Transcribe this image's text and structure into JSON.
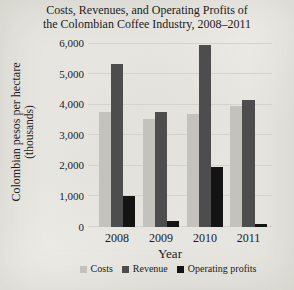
{
  "figure": {
    "background": "#ecebe6",
    "text_color": "#1b1b1b",
    "grid_color": "#d3d2cd"
  },
  "chart_data": {
    "type": "bar",
    "title": "Costs, Revenues, and Operating Profits of the Colombian Coffee Industry, 2008–2011",
    "title_line1": "Costs, Revenues, and Operating Profits of",
    "title_line2": "the Colombian Coffee Industry, 2008–2011",
    "ylabel_line1": "Colombian pesos per hectare",
    "ylabel_line2": "(thousands)",
    "xlabel": "Year",
    "categories": [
      "2008",
      "2009",
      "2010",
      "2011"
    ],
    "series": [
      {
        "name": "Costs",
        "color": "#c3c2bd",
        "values": [
          3750,
          3550,
          3700,
          3950
        ]
      },
      {
        "name": "Revenue",
        "color": "#4d4d4d",
        "values": [
          5350,
          3750,
          5950,
          4150
        ]
      },
      {
        "name": "Operating profits",
        "color": "#141414",
        "values": [
          1000,
          200,
          1950,
          100
        ]
      }
    ],
    "ylim": [
      0,
      6000
    ],
    "ytick_step": 1000,
    "yticks": [
      "0",
      "1,000",
      "2,000",
      "3,000",
      "4,000",
      "5,000",
      "6,000"
    ],
    "grid": true,
    "legend_position": "bottom"
  }
}
